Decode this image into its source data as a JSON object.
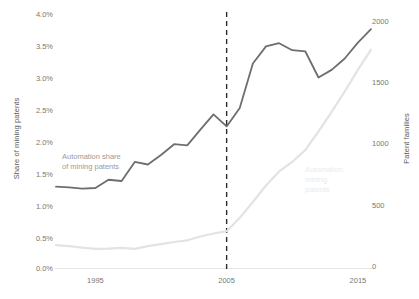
{
  "chart_data": {
    "type": "line",
    "title": "",
    "xlabel": "",
    "x": [
      1992,
      1993,
      1994,
      1995,
      1996,
      1997,
      1998,
      1999,
      2000,
      2001,
      2002,
      2003,
      2004,
      2005,
      2006,
      2007,
      2008,
      2009,
      2010,
      2011,
      2012,
      2013,
      2014,
      2015,
      2016
    ],
    "xticks": [
      1995,
      2005,
      2015
    ],
    "xlim": [
      1992,
      2016
    ],
    "grid": false,
    "legend_position": "inline-annotation",
    "annotations": [
      {
        "name": "automation-share-annotation",
        "text": "Automation share\nof mining patents",
        "series": "Automation share of mining patents",
        "color": "#9a9a9a"
      },
      {
        "name": "automation-mining-patents-annotation",
        "text": "Automation\nmining\npatents",
        "series": "Patent families",
        "color": "#ebebeb"
      }
    ],
    "reference_line": {
      "name": "year-2005-dashed-line",
      "x": 2005,
      "style": "dashed",
      "color": "#2b2b2b"
    },
    "axes": [
      {
        "id": "left",
        "label": "Share of mining patents",
        "ticks": [
          "0.0%",
          "0.5%",
          "1.0%",
          "1.5%",
          "2.0%",
          "2.5%",
          "3.0%",
          "3.5%",
          "4.0%"
        ],
        "tick_values": [
          0.0,
          0.5,
          1.0,
          1.5,
          2.0,
          2.5,
          3.0,
          3.5,
          4.0
        ],
        "lim": [
          0.0,
          4.0
        ],
        "unit": "percent"
      },
      {
        "id": "right",
        "label": "Patent families",
        "ticks": [
          "0",
          "500",
          "1000",
          "1500",
          "2000"
        ],
        "tick_values": [
          0,
          500,
          1000,
          1500,
          2000
        ],
        "lim": [
          0,
          2000
        ],
        "unit": "count"
      }
    ],
    "series": [
      {
        "name": "Automation share of mining patents",
        "axis": "left",
        "color": "#6e6e6e",
        "width": 1.8,
        "unit": "percent",
        "values": [
          1.28,
          1.27,
          1.25,
          1.26,
          1.39,
          1.37,
          1.67,
          1.63,
          1.78,
          1.95,
          1.93,
          2.18,
          2.42,
          2.23,
          2.52,
          3.22,
          3.49,
          3.54,
          3.43,
          3.41,
          3.0,
          3.12,
          3.3,
          3.55,
          3.76
        ]
      },
      {
        "name": "Patent families",
        "axis": "right",
        "color": "#e3e3e3",
        "width": 2.2,
        "unit": "count",
        "values": [
          180,
          172,
          160,
          150,
          152,
          158,
          150,
          172,
          188,
          205,
          218,
          248,
          272,
          290,
          395,
          520,
          650,
          760,
          835,
          930,
          1075,
          1230,
          1390,
          1560,
          1720
        ]
      }
    ]
  }
}
